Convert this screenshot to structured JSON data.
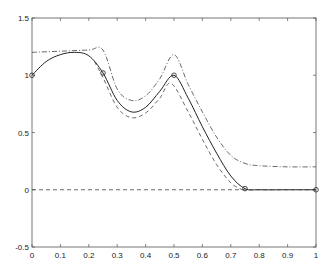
{
  "chart_data": {
    "type": "line",
    "title": "",
    "xlabel": "",
    "ylabel": "",
    "xlim": [
      0,
      1
    ],
    "ylim": [
      -0.5,
      1.5
    ],
    "grid": false,
    "legend": null,
    "x_ticks": [
      "0",
      "0.1",
      "0.2",
      "0.3",
      "0.4",
      "0.5",
      "0.6",
      "0.7",
      "0.8",
      "0.9",
      "1"
    ],
    "y_ticks": [
      "-0.5",
      "0",
      "0.5",
      "1",
      "1.5"
    ],
    "series": [
      {
        "name": "interpolant",
        "style": "solid",
        "x": [
          0,
          0.05,
          0.1,
          0.15,
          0.2,
          0.25,
          0.3,
          0.35,
          0.4,
          0.45,
          0.5,
          0.55,
          0.6,
          0.65,
          0.7,
          0.75,
          0.8,
          0.9,
          1.0
        ],
        "y": [
          1.0,
          1.12,
          1.18,
          1.2,
          1.17,
          1.02,
          0.78,
          0.68,
          0.72,
          0.86,
          1.0,
          0.8,
          0.55,
          0.32,
          0.12,
          0.01,
          0.0,
          0.0,
          0.0
        ]
      },
      {
        "name": "upper-bound",
        "style": "dashdot",
        "x": [
          0,
          0.1,
          0.2,
          0.25,
          0.3,
          0.35,
          0.4,
          0.45,
          0.5,
          0.55,
          0.6,
          0.65,
          0.7,
          0.75,
          0.8,
          0.9,
          1.0
        ],
        "y": [
          1.2,
          1.21,
          1.22,
          1.22,
          0.88,
          0.78,
          0.82,
          0.97,
          1.18,
          0.92,
          0.68,
          0.46,
          0.3,
          0.23,
          0.21,
          0.2,
          0.2
        ]
      },
      {
        "name": "lower-bound",
        "style": "dashed",
        "x": [
          0.22,
          0.25,
          0.3,
          0.35,
          0.4,
          0.45,
          0.49,
          0.55,
          0.6,
          0.65,
          0.7,
          0.74
        ],
        "y": [
          1.12,
          0.98,
          0.72,
          0.63,
          0.67,
          0.8,
          0.93,
          0.68,
          0.44,
          0.22,
          0.06,
          0.0
        ]
      },
      {
        "name": "zero-line",
        "style": "dashed",
        "x": [
          0,
          1
        ],
        "y": [
          0,
          0
        ]
      }
    ],
    "markers": {
      "style": "circle",
      "x": [
        0,
        0.25,
        0.5,
        0.75,
        1.0
      ],
      "y": [
        1.0,
        1.02,
        1.0,
        0.01,
        0.0
      ]
    }
  }
}
